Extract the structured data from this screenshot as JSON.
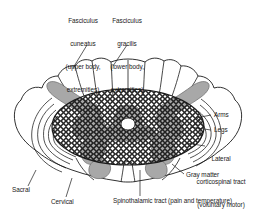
{
  "figure": {
    "type": "anatomical-diagram",
    "background_color": "#ffffff",
    "line_color": "#1a1a1a",
    "gray_matter_color": "#a8a8a8",
    "white_matter_color": "#ffffff",
    "hatch_color": "#1a1a1a"
  },
  "labels": {
    "fasciculus_cuneatus": {
      "line1": "Fasciculus",
      "line2": "cuneatus",
      "line3": "(upper body,",
      "line4": "extremities)"
    },
    "fasciculus_gracilis": {
      "line1": "Fasciculus",
      "line2": "gracilis",
      "line3": "(lower body,",
      "line4": "extremities)"
    },
    "arms": "Arms",
    "legs": "Legs",
    "lateral_corticospinal": {
      "line1": "Lateral",
      "line2": "corticospinal tract",
      "line3": "(voluntary motor)"
    },
    "gray_matter": "Gray matter",
    "spinothalamic": "Spinothalamic tract (pain and temperature)",
    "sacral": "Sacral",
    "cervical": "Cervical"
  },
  "structures": {
    "dorsal_columns": "posterior white column lobes",
    "posterior_horn": "gray posterior horn band",
    "anterior_horn": "gray anterior horn",
    "lateral_funiculus_laminations": "somatotopic lamination arcs",
    "crosshatch_region": "spinothalamic / anterolateral crosshatched field"
  }
}
